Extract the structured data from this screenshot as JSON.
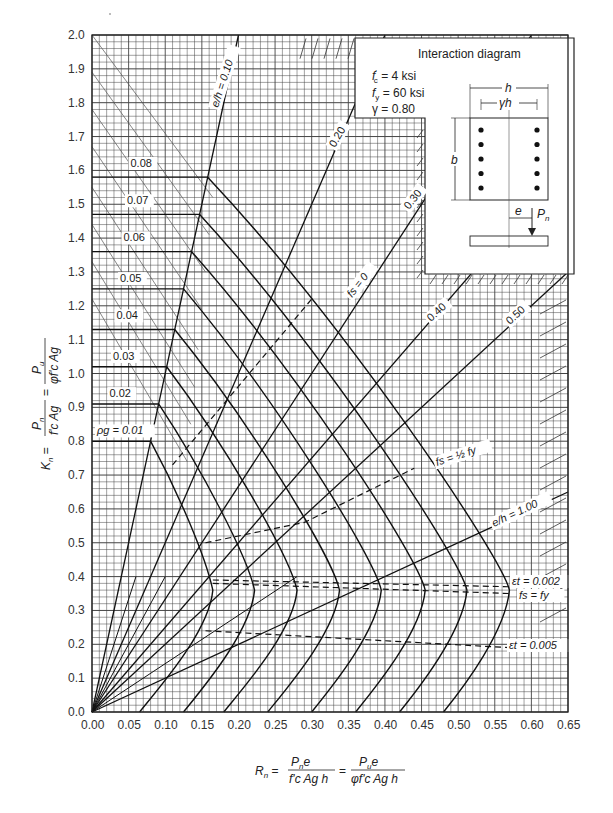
{
  "chart_data": {
    "type": "line",
    "title": "Interaction diagram",
    "parameters": {
      "fc": "f'c = 4 ksi",
      "fy": "fy = 60 ksi",
      "gamma": "γ = 0.80"
    },
    "xlabel": "Rn = Pn e / (f'c Ag h) = Pu e / (φ f'c Ag h)",
    "ylabel": "Kn = Pn / (f'c Ag) = Pu / (φ f'c Ag)",
    "xlim": [
      0,
      0.65
    ],
    "ylim": [
      0,
      2.0
    ],
    "grid": true,
    "x_ticks": [
      "0.00",
      "0.05",
      "0.10",
      "0.15",
      "0.20",
      "0.25",
      "0.30",
      "0.35",
      "0.40",
      "0.45",
      "0.50",
      "0.55",
      "0.60",
      "0.65"
    ],
    "y_ticks": [
      "0.0",
      "0.1",
      "0.2",
      "0.3",
      "0.4",
      "0.5",
      "0.6",
      "0.7",
      "0.8",
      "0.9",
      "1.0",
      "1.1",
      "1.2",
      "1.3",
      "1.4",
      "1.5",
      "1.6",
      "1.7",
      "1.8",
      "1.9",
      "2.0"
    ],
    "series": [
      {
        "name": "ρg = 0.01",
        "label": "ρg = 0.01",
        "kmax": 0.8,
        "nose_r": 0.165,
        "r0": 0.065
      },
      {
        "name": "0.02",
        "label": "0.02",
        "kmax": 0.91,
        "nose_r": 0.222,
        "r0": 0.125
      },
      {
        "name": "0.03",
        "label": "0.03",
        "kmax": 1.02,
        "nose_r": 0.28,
        "r0": 0.18
      },
      {
        "name": "0.04",
        "label": "0.04",
        "kmax": 1.13,
        "nose_r": 0.338,
        "r0": 0.24
      },
      {
        "name": "0.05",
        "label": "0.05",
        "kmax": 1.25,
        "nose_r": 0.395,
        "r0": 0.3
      },
      {
        "name": "0.06",
        "label": "0.06",
        "kmax": 1.36,
        "nose_r": 0.455,
        "r0": 0.36
      },
      {
        "name": "0.07",
        "label": "0.07",
        "kmax": 1.47,
        "nose_r": 0.512,
        "r0": 0.42
      },
      {
        "name": "0.08",
        "label": "0.08",
        "kmax": 1.58,
        "nose_r": 0.57,
        "r0": 0.48
      }
    ],
    "eccentricity_lines": [
      {
        "label": "e/h = 0.10",
        "e_h": 0.1
      },
      {
        "label": "0.20",
        "e_h": 0.2
      },
      {
        "label": "0.30",
        "e_h": 0.3
      },
      {
        "label": "0.40",
        "e_h": 0.4
      },
      {
        "label": "0.50",
        "e_h": 0.5
      },
      {
        "label": "e/h = 1.00",
        "e_h": 1.0
      }
    ],
    "strain_lines": [
      {
        "label": "fs = 0",
        "points": [
          [
            0.11,
            0.73
          ],
          [
            0.3,
            1.22
          ]
        ]
      },
      {
        "label": "fs = ½ fy",
        "points": [
          [
            0.155,
            0.5
          ],
          [
            0.29,
            0.56
          ],
          [
            0.44,
            0.72
          ]
        ]
      },
      {
        "label": "εt = 0.002",
        "points": [
          [
            0.165,
            0.39
          ],
          [
            0.57,
            0.37
          ]
        ]
      },
      {
        "label": "fs = fy",
        "points": [
          [
            0.165,
            0.38
          ],
          [
            0.57,
            0.35
          ]
        ]
      },
      {
        "label": "εt = 0.005",
        "points": [
          [
            0.155,
            0.24
          ],
          [
            0.57,
            0.19
          ]
        ]
      }
    ],
    "annotations": [
      "ρg = 0.01",
      "0.02",
      "0.03",
      "0.04",
      "0.05",
      "0.06",
      "0.07",
      "0.08",
      "e/h = 0.10",
      "0.20",
      "0.30",
      "0.40",
      "0.50",
      "e/h = 1.00",
      "fs = 0",
      "fs = ½fy",
      "εt = 0.002",
      "fs = fy",
      "εt = 0.005"
    ],
    "legend_position": "none"
  },
  "inset": {
    "title": "Interaction diagram",
    "line1": "= 4 ksi",
    "line2": "= 60 ksi",
    "line3": "γ = 0.80",
    "dim_h": "h",
    "dim_gh": "γh",
    "dim_b": "b",
    "dim_e": "e",
    "load": "P"
  },
  "axis": {
    "y_label_left": "Kn =",
    "y_label_num1": "P",
    "y_label_den1": "f'c Ag",
    "y_label_num2": "P",
    "y_label_den2": "φf'c Ag",
    "x_label_left": "R",
    "x_label_num1": "P e",
    "x_label_den1": "f'c Ag h",
    "x_label_num2": "P e",
    "x_label_den2": "φf'c Ag h"
  }
}
